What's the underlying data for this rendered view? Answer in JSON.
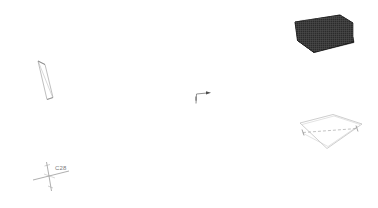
{
  "viewport": {
    "name": "cad-3d-viewport",
    "width": 378,
    "height": 208,
    "background_color": "#ffffff",
    "render_mode": "wireframe-and-shaded"
  },
  "gnomon": {
    "label": "C28",
    "axis_color": "#8c8c8c",
    "label_color": "#7a7a7a",
    "origin_x": 49,
    "origin_y": 176,
    "axes": [
      {
        "name": "x-axis",
        "dx": -16,
        "dy": 4
      },
      {
        "name": "y-axis",
        "dx": 20,
        "dy": -5
      },
      {
        "name": "z-axis-up",
        "dx": -2,
        "dy": -14
      },
      {
        "name": "z-axis-down",
        "dx": 3,
        "dy": 15
      }
    ]
  },
  "axis_indicator": {
    "name": "direction-arrow-marker",
    "color": "#6e6e6e",
    "origin_x": 196,
    "origin_y": 103,
    "vertical_length": 10,
    "horizontal_length": 11,
    "arrow_label": ""
  },
  "entities": [
    {
      "id": "entity-slab-shaded",
      "label": "shaded-slab",
      "type": "shaded-solid",
      "fill_color": "#2b2b2b",
      "hatch_color": "#4a4a4a",
      "edge_color": "#1a1a1a",
      "side_face_color": "#141414",
      "position": {
        "x": 296,
        "y": 16
      },
      "size": {
        "w": 58,
        "h": 36
      }
    },
    {
      "id": "entity-panel-wire",
      "label": "wireframe-panel",
      "type": "wireframe-quad",
      "stroke_color": "#b4b4b4",
      "fill_color": "#ffffff",
      "centerline": "dashed",
      "centerline_color": "#9a9a9a",
      "position": {
        "x": 298,
        "y": 114
      },
      "size": {
        "w": 64,
        "h": 36
      }
    },
    {
      "id": "entity-blade-wire",
      "label": "thin-angled-quad",
      "type": "wireframe-quad",
      "stroke_color": "#9e9e9e",
      "fill_color": "#ffffff",
      "position": {
        "x": 36,
        "y": 60
      },
      "size": {
        "w": 18,
        "h": 40
      }
    }
  ],
  "colors": {
    "canvas": "#ffffff",
    "dark_solid": "#2b2b2b",
    "light_wire": "#b4b4b4",
    "mid_wire": "#9e9e9e",
    "annotation": "#7a7a7a"
  }
}
